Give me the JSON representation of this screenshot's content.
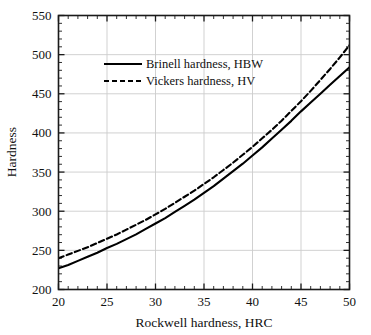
{
  "chart_data": {
    "type": "line",
    "title": "",
    "xlabel": "Rockwell hardness, HRC",
    "ylabel": "Hardness",
    "xlim": [
      20,
      50
    ],
    "ylim": [
      200,
      550
    ],
    "xticks": [
      20,
      25,
      30,
      35,
      40,
      45,
      50
    ],
    "yticks": [
      200,
      250,
      300,
      350,
      400,
      450,
      500,
      550
    ],
    "xtick_labels": [
      "20",
      "25",
      "30",
      "35",
      "40",
      "45",
      "50"
    ],
    "ytick_labels": [
      "200",
      "250",
      "300",
      "350",
      "400",
      "450",
      "500",
      "550"
    ],
    "x_minor_step": 1,
    "y_minor_step": 10,
    "grid": true,
    "grid_color": "#cccccc",
    "legend_position": "upper-left-inside",
    "x": [
      20,
      21,
      22,
      23,
      24,
      25,
      26,
      27,
      28,
      29,
      30,
      31,
      32,
      33,
      34,
      35,
      36,
      37,
      38,
      39,
      40,
      41,
      42,
      43,
      44,
      45,
      46,
      47,
      48,
      49,
      50
    ],
    "series": [
      {
        "name": "Brinell hardness, HBW",
        "style": "solid",
        "color": "#000000",
        "values": [
          227,
          232,
          238,
          244,
          250,
          257,
          263,
          270,
          277,
          285,
          293,
          301,
          310,
          319,
          328,
          338,
          348,
          359,
          370,
          381,
          393,
          405,
          418,
          431,
          444,
          458,
          471,
          484,
          497,
          510,
          523
        ]
      },
      {
        "name": "Vickers hardness, HV",
        "style": "dashed",
        "color": "#000000",
        "values": [
          240,
          246,
          252,
          258,
          265,
          272,
          279,
          287,
          295,
          303,
          312,
          321,
          331,
          341,
          351,
          362,
          373,
          385,
          397,
          410,
          423,
          437,
          451,
          466,
          482,
          498,
          515,
          533,
          551,
          570,
          590
        ]
      }
    ],
    "series_clip": {
      "Brinell hardness, HBW": {
        "x_end": 50,
        "y_end": 484
      },
      "Vickers hardness, HV": {
        "x_end": 50,
        "y_end": 512
      }
    }
  },
  "legend": {
    "items": [
      {
        "label": "Brinell hardness, HBW",
        "style": "solid"
      },
      {
        "label": "Vickers hardness, HV",
        "style": "dashed"
      }
    ]
  },
  "axes": {
    "x_title": "Rockwell hardness, HRC",
    "y_title": "Hardness"
  }
}
